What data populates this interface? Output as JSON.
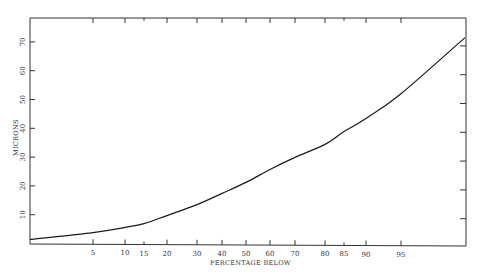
{
  "chart_data": {
    "type": "line",
    "title": "",
    "xlabel": "PERCENTAGE BELOW",
    "ylabel": "MICRONS",
    "x_scale": "probability (normal percentage scale)",
    "x_tick_labels": [
      "5",
      "10",
      "15",
      "20",
      "30",
      "40",
      "50",
      "60",
      "70",
      "80",
      "85",
      "90",
      "95"
    ],
    "y_tick_labels": [
      "10",
      "20",
      "30",
      "40",
      "50",
      "60",
      "70"
    ],
    "ylim": [
      0,
      76
    ],
    "grid": false,
    "legend": null,
    "series": [
      {
        "name": "Cumulative size distribution",
        "x": [
          1,
          5,
          10,
          15,
          20,
          30,
          40,
          50,
          60,
          70,
          80,
          85,
          90,
          95,
          99
        ],
        "values": [
          1.4,
          3.8,
          5.6,
          6.9,
          9.7,
          13.5,
          17.4,
          21.2,
          25.7,
          29.9,
          34.4,
          38.9,
          43.4,
          52.0,
          71.5
        ]
      }
    ]
  },
  "axes": {
    "x_title": "PERCENTAGE BELOW",
    "y_title": "MICRONS"
  }
}
